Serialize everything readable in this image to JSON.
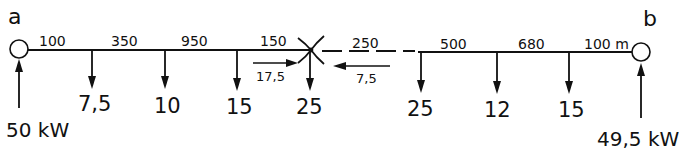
{
  "nodes": {
    "a": {
      "label": "a",
      "feed": "50 kW"
    },
    "b": {
      "label": "b",
      "feed": "49,5 kW"
    }
  },
  "segments": [
    {
      "label": "100"
    },
    {
      "label": "350"
    },
    {
      "label": "950"
    },
    {
      "label": "150"
    },
    {
      "label": "250"
    },
    {
      "label": "500"
    },
    {
      "label": "680"
    },
    {
      "label": "100 m"
    }
  ],
  "loads": [
    {
      "label": "7,5"
    },
    {
      "label": "10"
    },
    {
      "label": "15"
    },
    {
      "label": "25"
    },
    {
      "label": "25"
    },
    {
      "label": "12"
    },
    {
      "label": "15"
    }
  ],
  "flows": {
    "left": "17,5",
    "right": "7,5"
  },
  "colors": {
    "line": "#111111",
    "background": "#ffffff"
  }
}
